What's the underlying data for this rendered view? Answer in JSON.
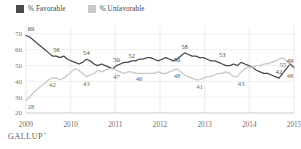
{
  "legend": {
    "favorable_label": "% Favorable",
    "unfavorable_label": "% Unfavorable",
    "favorable_color": "#4a4a4a",
    "unfavorable_color": "#c6c6c6"
  },
  "footer": {
    "brand": "GALLUP",
    "trademark": "®"
  },
  "chart_data": {
    "type": "line",
    "title": "",
    "subtitle": "",
    "xlabel": "",
    "ylabel": "",
    "ylim": [
      20,
      75
    ],
    "yticks": [
      20,
      30,
      40,
      50,
      60,
      70
    ],
    "xticks": [
      "2009",
      "2010",
      "2011",
      "2012",
      "2013",
      "2014",
      "2015"
    ],
    "grid": true,
    "legend_position": "top-left",
    "series": [
      {
        "name": "% Favorable",
        "color": "#4a4a4a",
        "values": [
          69,
          68,
          66,
          64,
          62,
          60,
          58,
          56,
          56,
          55,
          56,
          54,
          53,
          52,
          51,
          52,
          54,
          53,
          51,
          50,
          51,
          50,
          49,
          48,
          50,
          51,
          52,
          52,
          53,
          53,
          54,
          54,
          55,
          55,
          54,
          53,
          54,
          55,
          54,
          53,
          54,
          56,
          58,
          57,
          56,
          56,
          55,
          55,
          54,
          53,
          53,
          52,
          51,
          50,
          50,
          51,
          50,
          52,
          51,
          50,
          49,
          47,
          46,
          45,
          45,
          44,
          43,
          42,
          45,
          48,
          51,
          49
        ],
        "labeled_points": [
          {
            "index": 0,
            "value": 69
          },
          {
            "index": 8,
            "value": 56
          },
          {
            "index": 16,
            "value": 54
          },
          {
            "index": 24,
            "value": 50
          },
          {
            "index": 28,
            "value": 52
          },
          {
            "index": 40,
            "value": 50
          },
          {
            "index": 42,
            "value": 58
          },
          {
            "index": 52,
            "value": 53
          },
          {
            "index": 67,
            "value": 42
          },
          {
            "index": 71,
            "value": 49
          }
        ]
      },
      {
        "name": "% Unfavorable",
        "color": "#c6c6c6",
        "values": [
          28,
          30,
          33,
          35,
          37,
          39,
          41,
          42,
          42,
          41,
          42,
          44,
          46,
          48,
          47,
          45,
          43,
          44,
          45,
          47,
          46,
          47,
          48,
          48,
          47,
          46,
          45,
          46,
          46,
          45,
          45,
          45,
          45,
          45,
          45,
          46,
          45,
          45,
          46,
          47,
          48,
          46,
          44,
          43,
          42,
          41,
          41,
          42,
          43,
          43,
          44,
          45,
          45,
          46,
          45,
          43,
          43,
          46,
          48,
          49,
          49,
          50,
          50,
          51,
          51,
          52,
          53,
          54,
          55,
          53,
          50,
          48
        ],
        "labeled_points": [
          {
            "index": 0,
            "value": 28
          },
          {
            "index": 7,
            "value": 42
          },
          {
            "index": 16,
            "value": 43
          },
          {
            "index": 24,
            "value": 47
          },
          {
            "index": 30,
            "value": 46
          },
          {
            "index": 40,
            "value": 48
          },
          {
            "index": 46,
            "value": 41
          },
          {
            "index": 57,
            "value": 43
          },
          {
            "index": 68,
            "value": 55
          },
          {
            "index": 71,
            "value": 48
          }
        ]
      }
    ]
  }
}
